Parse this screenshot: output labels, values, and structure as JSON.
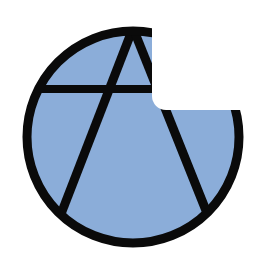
{
  "image": {
    "width": 257,
    "height": 257,
    "background": "#ffffff",
    "label": "Circled A symbol"
  },
  "symbol": {
    "name": "circle-a",
    "circle": {
      "cx": 133,
      "cy": 137,
      "r": 106,
      "stroke_width": 9
    },
    "fill_color": "#8badd9",
    "stroke_color": "#0a0a0a",
    "letter": {
      "apex": [
        133,
        28
      ],
      "left_foot": [
        61,
        214
      ],
      "right_foot": [
        207,
        213
      ],
      "crossbar_y": 89,
      "crossbar_x": [
        30,
        236
      ]
    }
  },
  "occlusion": {
    "color": "#ffffff",
    "x": 152,
    "y": 0,
    "width": 105,
    "height": 110,
    "corner_radius": 14
  }
}
